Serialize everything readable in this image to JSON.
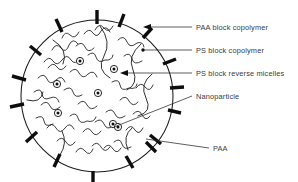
{
  "figure": {
    "background_color": "#ffffff",
    "ink_color": "#1a1a1a",
    "text_color": "#3a3a3a",
    "boundary": {
      "shape": "circle",
      "center_x": 97,
      "center_y": 96,
      "radius": 76
    },
    "labels": [
      {
        "id": "paa-block-copolymer",
        "text": "PAA block copolymer",
        "x": 196,
        "y": 30,
        "leader": "line-with-arrowhead",
        "points_to": "paa-bar-upper-right"
      },
      {
        "id": "ps-block-copolymer",
        "text": "PS block copolymer",
        "x": 196,
        "y": 53,
        "leader": "line-with-dot",
        "points_to": "ps-chain-upper-right"
      },
      {
        "id": "ps-block-reverse-micelles",
        "text": "PS block reverse micelles",
        "x": 196,
        "y": 76,
        "leader": "line-with-arrowhead",
        "points_to": "micelle-interior"
      },
      {
        "id": "nanoparticle",
        "text": "Nanoparticle",
        "x": 196,
        "y": 99,
        "leader": "long-diagonal-line",
        "points_to": "nanoparticle-lower-center"
      },
      {
        "id": "paa",
        "text": "PAA",
        "x": 213,
        "y": 151,
        "leader": "short-diagonal-line",
        "points_to": "paa-bar-lower-right"
      }
    ],
    "nanoparticles": {
      "count": 7,
      "outer_radius": 3.6,
      "core_radius": 1.5,
      "positions": [
        {
          "x": 80,
          "y": 61
        },
        {
          "x": 114,
          "y": 69
        },
        {
          "x": 57,
          "y": 84
        },
        {
          "x": 98,
          "y": 93
        },
        {
          "x": 58,
          "y": 113
        },
        {
          "x": 113,
          "y": 124
        },
        {
          "x": 118,
          "y": 127
        }
      ]
    },
    "paa_bars": {
      "count": 16,
      "length": 12,
      "thickness": 3.4,
      "description": "thick black rods radiating from the circle perimeter",
      "angles_deg": [
        272,
        297,
        318,
        336,
        352,
        8,
        26,
        44,
        62,
        80,
        100,
        120,
        140,
        162,
        196,
        232
      ]
    },
    "ps_chains": {
      "count": 26,
      "description": "thin wavy squiggle curves filling the circle interior representing PS blocks"
    }
  }
}
